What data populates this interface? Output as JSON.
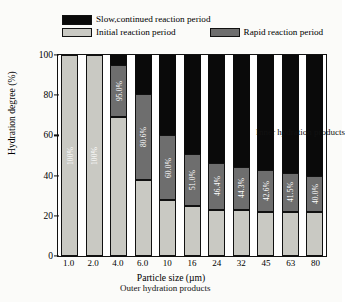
{
  "chart_data": {
    "type": "bar",
    "subtype": "stacked-percentage",
    "title": "",
    "xlabel": "Particle size (µm)",
    "ylabel": "Hydration degree (%)",
    "ylim": [
      0,
      100
    ],
    "yticks": [
      0,
      20,
      40,
      60,
      80,
      100
    ],
    "grid": false,
    "legend_position": "above-plot",
    "categories": [
      "1.0",
      "2.0",
      "4.0",
      "6.0",
      "10",
      "16",
      "24",
      "32",
      "45",
      "63",
      "80"
    ],
    "series": [
      {
        "name": "Initial reaction period",
        "color": "#c9c9c3",
        "values": [
          100,
          100,
          69,
          38,
          28,
          25,
          23,
          23,
          22,
          22,
          22
        ]
      },
      {
        "name": "Rapid reaction period",
        "color": "#6e6e6e",
        "values": [
          0,
          0,
          26,
          42.6,
          32,
          26,
          23.4,
          21.3,
          20.6,
          19.5,
          18
        ]
      },
      {
        "name": "Slow,continued reaction period",
        "color": "#0a0a0a",
        "values": [
          0,
          0,
          5,
          19.4,
          40,
          49,
          53.6,
          55.7,
          57.4,
          58.5,
          60
        ]
      }
    ],
    "bar_labels": [
      "100%",
      "100%",
      "95.0%",
      "80.6%",
      "60.0%",
      "51.0%",
      "46.4%",
      "44.3%",
      "42.6%",
      "41.5%",
      "40.0%"
    ],
    "annotations": [
      {
        "text": "Inner hydration products",
        "region": "upper-right"
      },
      {
        "text": "Outer hydration products",
        "region": "lower-left"
      }
    ]
  },
  "legend": {
    "items": [
      {
        "label": "Slow,continued reaction period",
        "swatch": "black"
      },
      {
        "label": "Initial reaction period",
        "swatch": "light-gray"
      },
      {
        "label": "Rapid reaction period",
        "swatch": "dark-gray"
      }
    ]
  }
}
